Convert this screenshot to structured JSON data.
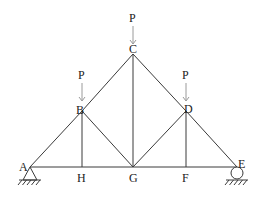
{
  "diagram": {
    "type": "truss",
    "nodes": [
      {
        "id": "A",
        "label": "A"
      },
      {
        "id": "B",
        "label": "B"
      },
      {
        "id": "C",
        "label": "C"
      },
      {
        "id": "D",
        "label": "D"
      },
      {
        "id": "E",
        "label": "E"
      },
      {
        "id": "F",
        "label": "F"
      },
      {
        "id": "G",
        "label": "G"
      },
      {
        "id": "H",
        "label": "H"
      }
    ],
    "members": [
      [
        "A",
        "B"
      ],
      [
        "B",
        "C"
      ],
      [
        "C",
        "D"
      ],
      [
        "D",
        "E"
      ],
      [
        "A",
        "H"
      ],
      [
        "H",
        "G"
      ],
      [
        "G",
        "F"
      ],
      [
        "F",
        "E"
      ],
      [
        "B",
        "H"
      ],
      [
        "B",
        "G"
      ],
      [
        "C",
        "G"
      ],
      [
        "D",
        "G"
      ],
      [
        "D",
        "F"
      ]
    ],
    "loads": [
      {
        "node": "B",
        "label": "P",
        "direction": "down"
      },
      {
        "node": "C",
        "label": "P",
        "direction": "down"
      },
      {
        "node": "D",
        "label": "P",
        "direction": "down"
      }
    ],
    "supports": [
      {
        "node": "A",
        "type": "pin"
      },
      {
        "node": "E",
        "type": "roller"
      }
    ],
    "colors": {
      "member": "#3a3a3a",
      "load_arrow": "#9a9a9a",
      "text": "#222222"
    }
  }
}
